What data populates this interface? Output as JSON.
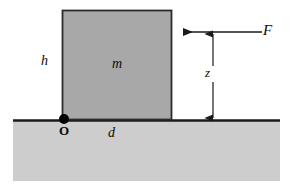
{
  "figure": {
    "background_color": "#ffffff"
  },
  "colors": {
    "block_fill": "#a8a8a8",
    "block_stroke": "#2b2b2b",
    "ground_fill": "#cdcdcd",
    "ground_line": "#1a1a1a",
    "arrow": "#1a1a1a",
    "point_marker": "#000000",
    "label_text": "#0a0a0a"
  },
  "labels": {
    "height": "h",
    "mass": "m",
    "distance": "d",
    "force_height": "z",
    "force": "F",
    "origin": "O"
  },
  "geometry": {
    "block": {
      "x": 62,
      "y": 10,
      "width": 110,
      "height": 110
    },
    "ground": {
      "x": 13,
      "y": 121,
      "width": 267,
      "height": 60
    },
    "ground_line_y": 120,
    "origin_point": {
      "x": 64,
      "y": 119,
      "radius": 5
    },
    "force_arrow": {
      "x_start": 262,
      "x_end": 173,
      "y": 32
    },
    "dimension_arrow": {
      "x": 213,
      "y_top": 32,
      "y_bottom": 120
    }
  }
}
